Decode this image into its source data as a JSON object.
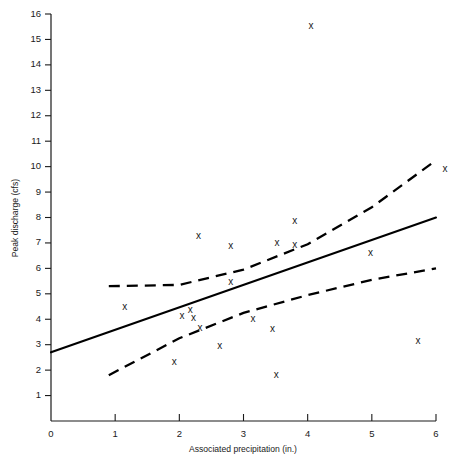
{
  "chart_data": {
    "type": "scatter",
    "title": "",
    "xlabel": "Associated precipitation (in.)",
    "ylabel": "Peak discharge (cfs)",
    "xlim": [
      0,
      6
    ],
    "ylim": [
      0,
      16
    ],
    "xticks": [
      0,
      1,
      2,
      3,
      4,
      5,
      6
    ],
    "yticks": [
      1,
      2,
      3,
      4,
      5,
      6,
      7,
      8,
      9,
      10,
      11,
      12,
      13,
      14,
      15,
      16
    ],
    "grid": false,
    "legend": "none",
    "marker": "x",
    "points": [
      {
        "x": 1.15,
        "y": 4.45
      },
      {
        "x": 1.92,
        "y": 2.29
      },
      {
        "x": 2.04,
        "y": 4.1
      },
      {
        "x": 2.17,
        "y": 4.35
      },
      {
        "x": 2.22,
        "y": 4.05
      },
      {
        "x": 2.3,
        "y": 7.25
      },
      {
        "x": 2.32,
        "y": 3.65
      },
      {
        "x": 2.63,
        "y": 2.92
      },
      {
        "x": 2.8,
        "y": 6.85
      },
      {
        "x": 2.8,
        "y": 5.45
      },
      {
        "x": 3.15,
        "y": 4.0
      },
      {
        "x": 3.45,
        "y": 3.6
      },
      {
        "x": 3.51,
        "y": 1.79
      },
      {
        "x": 3.52,
        "y": 7.0
      },
      {
        "x": 3.8,
        "y": 7.85
      },
      {
        "x": 3.8,
        "y": 6.9
      },
      {
        "x": 4.05,
        "y": 15.5
      },
      {
        "x": 4.98,
        "y": 6.6
      },
      {
        "x": 5.72,
        "y": 3.13
      },
      {
        "x": 6.14,
        "y": 9.9
      }
    ],
    "series": [
      {
        "name": "regression-line",
        "style": "solid",
        "x": [
          0,
          6
        ],
        "y": [
          2.7,
          8.0
        ]
      },
      {
        "name": "upper-confidence-band",
        "style": "dashed",
        "x": [
          0.9,
          2.0,
          3.0,
          4.0,
          5.0,
          6.0
        ],
        "y": [
          5.3,
          5.35,
          5.95,
          6.95,
          8.4,
          10.25
        ]
      },
      {
        "name": "lower-confidence-band",
        "style": "dashed",
        "x": [
          0.9,
          2.0,
          3.0,
          4.0,
          5.0,
          6.0
        ],
        "y": [
          1.8,
          3.25,
          4.25,
          4.95,
          5.55,
          6.0
        ]
      }
    ]
  },
  "axes": {
    "y_title": "Peak discharge (cfs)",
    "x_title": "Associated precipitation (in.)"
  }
}
